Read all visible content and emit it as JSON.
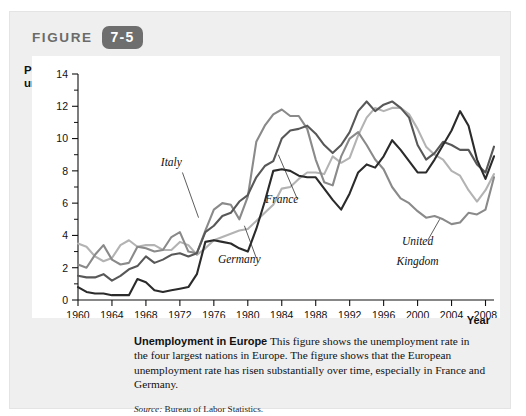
{
  "header": {
    "figure_word": "FIGURE",
    "figure_number": "7-5"
  },
  "axis_titles": {
    "y_line1": "Percent",
    "y_line2": "unemployed",
    "x_label": "Year"
  },
  "caption": {
    "lead": "Unemployment in Europe",
    "body": "This figure shows the unemployment rate in the four largest nations in Europe. The figure shows that the European unemployment rate has risen substantially over time, especially in France and Germany."
  },
  "source": {
    "prefix": "Source:",
    "text": "Bureau of Labor Statistics."
  },
  "chart_data": {
    "type": "line",
    "title": "Unemployment in Europe",
    "xlabel": "Year",
    "ylabel": "Percent unemployed",
    "xlim": [
      1960,
      2009
    ],
    "ylim": [
      0,
      14
    ],
    "ytick_labels": [
      "0",
      "2",
      "4",
      "6",
      "8",
      "10",
      "12",
      "14"
    ],
    "ytick_values": [
      0,
      2,
      4,
      6,
      8,
      10,
      12,
      14
    ],
    "yminor_values": [
      1,
      3,
      5,
      7,
      9,
      11,
      13
    ],
    "xtick_labels": [
      "1960",
      "1964",
      "1968",
      "1972",
      "1976",
      "1980",
      "1984",
      "1988",
      "1992",
      "1996",
      "2000",
      "2004",
      "2008"
    ],
    "xtick_values": [
      1960,
      1964,
      1968,
      1972,
      1976,
      1980,
      1984,
      1988,
      1992,
      1996,
      2000,
      2004,
      2008
    ],
    "grid": false,
    "legend": "inline-annotations",
    "x": [
      1960,
      1961,
      1962,
      1963,
      1964,
      1965,
      1966,
      1967,
      1968,
      1969,
      1970,
      1971,
      1972,
      1973,
      1974,
      1975,
      1976,
      1977,
      1978,
      1979,
      1980,
      1981,
      1982,
      1983,
      1984,
      1985,
      1986,
      1987,
      1988,
      1989,
      1990,
      1991,
      1992,
      1993,
      1994,
      1995,
      1996,
      1997,
      1998,
      1999,
      2000,
      2001,
      2002,
      2003,
      2004,
      2005,
      2006,
      2007,
      2008,
      2009
    ],
    "series": [
      {
        "name": "Italy",
        "color": "#b3b3b3",
        "label_x": 1971,
        "label_y": 8.3,
        "values": [
          3.5,
          3.3,
          2.7,
          2.4,
          2.6,
          3.4,
          3.7,
          3.3,
          3.4,
          3.4,
          3.1,
          3.1,
          3.6,
          3.4,
          2.8,
          3.2,
          3.7,
          3.9,
          4.1,
          4.3,
          4.4,
          4.9,
          5.4,
          5.9,
          6.9,
          7.0,
          7.5,
          7.9,
          7.9,
          7.8,
          8.9,
          8.5,
          8.8,
          10.2,
          11.3,
          11.9,
          11.7,
          11.9,
          11.9,
          11.5,
          10.6,
          9.5,
          9.0,
          8.7,
          8.0,
          7.7,
          6.8,
          6.1,
          6.8,
          7.8
        ]
      },
      {
        "name": "United Kingdom",
        "color": "#8a8a8a",
        "label_x": 2000,
        "label_y": 3.4,
        "label_line2_dy": 1.25,
        "values": [
          2.2,
          2.0,
          2.8,
          3.4,
          2.5,
          2.2,
          2.3,
          3.3,
          3.2,
          3.0,
          3.1,
          3.9,
          4.2,
          3.0,
          2.9,
          4.3,
          5.6,
          6.0,
          5.9,
          5.0,
          6.4,
          9.8,
          10.8,
          11.5,
          11.8,
          11.4,
          11.4,
          10.6,
          8.7,
          7.3,
          7.1,
          8.9,
          10.0,
          10.4,
          9.6,
          8.7,
          8.1,
          7.0,
          6.3,
          6.0,
          5.5,
          5.1,
          5.2,
          5.0,
          4.7,
          4.8,
          5.4,
          5.3,
          5.6,
          7.6
        ]
      },
      {
        "name": "France",
        "color": "#585858",
        "label_x": 1984,
        "label_y": 6.0,
        "values": [
          1.5,
          1.4,
          1.4,
          1.6,
          1.2,
          1.5,
          1.9,
          2.1,
          2.7,
          2.3,
          2.5,
          2.8,
          2.9,
          2.7,
          2.9,
          4.2,
          4.6,
          5.2,
          5.4,
          6.1,
          6.5,
          7.6,
          8.3,
          8.6,
          10.0,
          10.5,
          10.6,
          10.8,
          10.3,
          9.6,
          9.1,
          9.6,
          10.4,
          11.7,
          12.3,
          11.7,
          12.1,
          12.3,
          11.9,
          11.3,
          9.6,
          8.7,
          9.1,
          9.8,
          9.6,
          9.3,
          9.3,
          8.4,
          7.9,
          9.5
        ]
      },
      {
        "name": "Germany",
        "color": "#2b2b2b",
        "label_x": 1979,
        "label_y": 2.3,
        "values": [
          0.8,
          0.5,
          0.4,
          0.4,
          0.3,
          0.3,
          0.3,
          1.3,
          1.1,
          0.6,
          0.5,
          0.6,
          0.7,
          0.8,
          1.6,
          3.6,
          3.7,
          3.6,
          3.5,
          3.2,
          3.0,
          4.4,
          6.1,
          8.0,
          8.1,
          8.0,
          7.7,
          7.6,
          7.6,
          6.9,
          6.2,
          5.6,
          6.6,
          7.9,
          8.4,
          8.2,
          8.9,
          9.9,
          9.3,
          8.6,
          7.9,
          7.9,
          8.7,
          9.6,
          10.5,
          11.7,
          10.8,
          8.7,
          7.5,
          8.9
        ]
      }
    ],
    "annotations": [
      {
        "text": "Italy",
        "leader_from_x": 1972.3,
        "leader_from_y": 7.9,
        "leader_to_x": 1974.2,
        "leader_to_y": 5.1
      },
      {
        "text": "Germany",
        "leader_from_x": 1981.0,
        "leader_from_y": 2.6,
        "leader_to_x": 1979.6,
        "leader_to_y": 4.6
      },
      {
        "text": "France",
        "leader_from_x": 1985.8,
        "leader_from_y": 6.3,
        "leader_to_x": 1983.6,
        "leader_to_y": 9.0
      },
      {
        "text": "United Kingdom",
        "leader_from_x": 2001.2,
        "leader_from_y": 3.7,
        "leader_to_x": 2002.6,
        "leader_to_y": 5.0
      }
    ]
  }
}
